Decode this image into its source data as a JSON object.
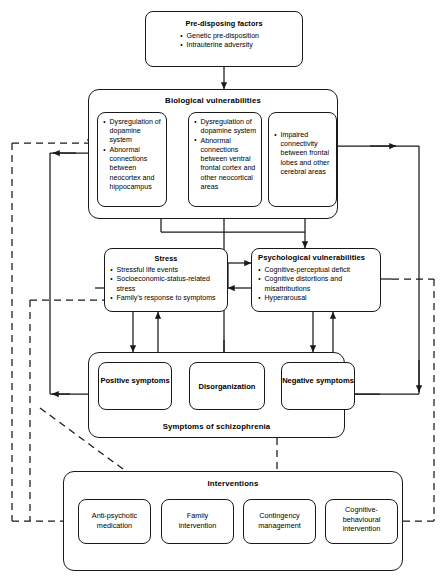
{
  "diagram": {
    "nodes": {
      "predisposing": {
        "label": "Pre-disposing factors",
        "items": [
          "Genetic pre-disposition",
          "Intrauterine adversity"
        ]
      },
      "biological": {
        "label": "Biological vulnerabilities",
        "boxes": [
          {
            "name": "bio-box-1",
            "items": [
              "Dysregulation of dopamine system",
              "Abnormal connections between neocortex and hippocampus"
            ]
          },
          {
            "name": "bio-box-2",
            "items": [
              "Dysregulation of dopamine system",
              "Abnormal connections between ventral frontal cortex and other neocortical areas"
            ]
          },
          {
            "name": "bio-box-3",
            "items": [
              "Impaired connectivity between frontal lobes and other cerebral areas"
            ]
          }
        ]
      },
      "stress": {
        "label": "Stress",
        "items": [
          "Stressful life events",
          "Socioeconomic-status-related stress",
          "Family's response to symptoms"
        ]
      },
      "psychological": {
        "label": "Psychological  vulnerabilities",
        "items": [
          "Cognitive-perceptual deficit",
          "Cognitive distortions and misattributions",
          "Hyperarousal"
        ]
      },
      "symptoms": {
        "label": "Symptoms of schizophrenia",
        "boxes": [
          {
            "name": "positive-symptoms",
            "label": "Positive symptoms"
          },
          {
            "name": "disorganization",
            "label": "Disorganization"
          },
          {
            "name": "negative-symptoms",
            "label": "Negative symptoms"
          }
        ]
      },
      "interventions": {
        "label": "Interventions",
        "boxes": [
          {
            "name": "anti-psychotic-medication",
            "label": "Anti-psychotic medication"
          },
          {
            "name": "family-intervention",
            "label": "Family intervention"
          },
          {
            "name": "contingency-management",
            "label": "Contingency management"
          },
          {
            "name": "cognitive-behavioural-intervention",
            "label": "Cognitive-behavioural intervention"
          }
        ]
      }
    },
    "colors": {
      "stroke": "#1a1a1a",
      "background": "#ffffff",
      "text": "#000000"
    }
  }
}
